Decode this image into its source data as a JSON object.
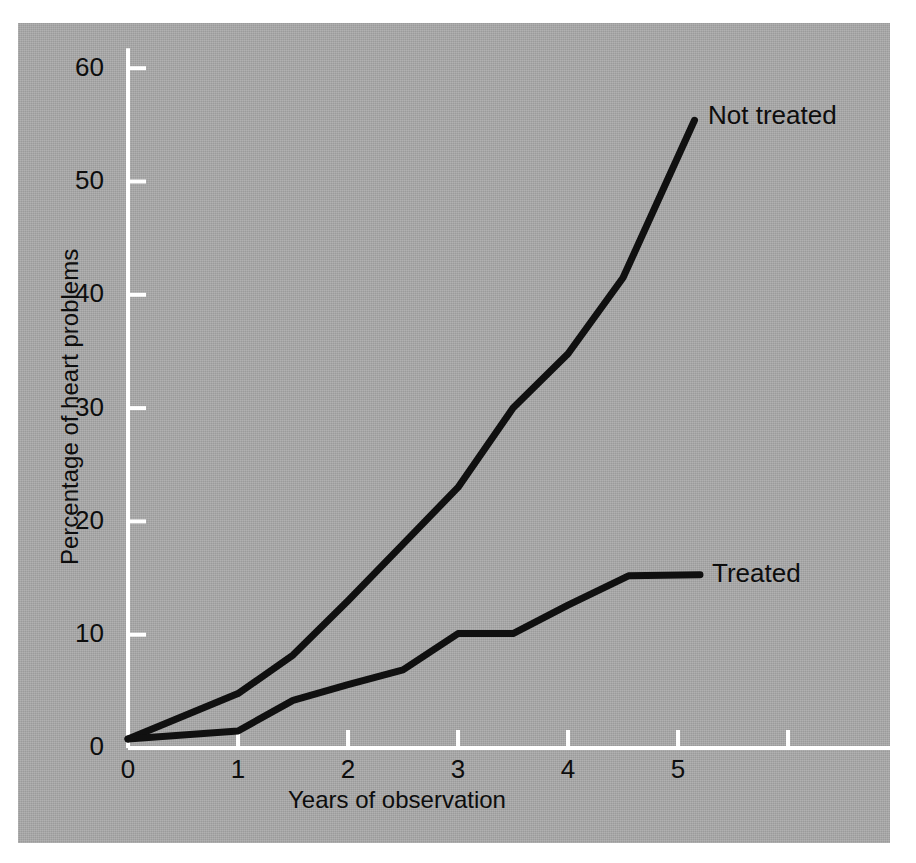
{
  "figure": {
    "background_color": "#ffffff",
    "panel_color": "#a9a9a9",
    "axis_color": "#ffffff",
    "ink_color": "#0d0d0d"
  },
  "chart_data": {
    "type": "line",
    "title": "",
    "xlabel": "Years of observation",
    "ylabel": "Percentage of heart problems",
    "xlim": [
      0,
      6.9
    ],
    "ylim": [
      0,
      60
    ],
    "xticks": [
      0,
      1,
      2,
      3,
      4,
      5
    ],
    "xtick_labels": [
      "0",
      "1",
      "2",
      "3",
      "4",
      "5"
    ],
    "yticks": [
      0,
      10,
      20,
      30,
      40,
      50,
      60
    ],
    "ytick_labels": [
      "0",
      "10",
      "20",
      "30",
      "40",
      "50",
      "60"
    ],
    "grid": false,
    "legend": "inline-end-of-line labels",
    "series": [
      {
        "name": "Not treated",
        "color": "#101010",
        "x": [
          0,
          1,
          1.5,
          2,
          2.5,
          3,
          3.5,
          4,
          4.5,
          5.15
        ],
        "y": [
          0.8,
          4.8,
          8.2,
          13.0,
          18.0,
          23.0,
          30.0,
          34.8,
          41.5,
          55.4
        ]
      },
      {
        "name": "Treated",
        "color": "#101010",
        "x": [
          0,
          1,
          1.5,
          2,
          2.5,
          3,
          3.5,
          4,
          4.55,
          5.2
        ],
        "y": [
          0.8,
          1.5,
          4.2,
          5.6,
          6.9,
          10.1,
          10.1,
          12.6,
          15.2,
          15.3
        ]
      }
    ]
  },
  "annotations": {
    "not_treated_label": "Not treated",
    "treated_label": "Treated"
  }
}
